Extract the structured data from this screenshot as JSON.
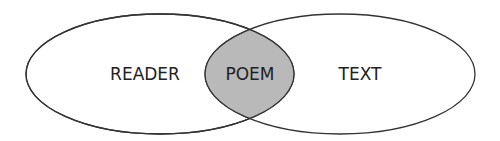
{
  "diagram": {
    "type": "venn",
    "sets": [
      {
        "id": "left",
        "label": "READER"
      },
      {
        "id": "right",
        "label": "TEXT"
      }
    ],
    "intersection": {
      "label": "POEM",
      "fill": "#b9b9b9"
    },
    "colors": {
      "stroke": "#333333",
      "set_fill": "#ffffff",
      "text": "#222222"
    }
  }
}
